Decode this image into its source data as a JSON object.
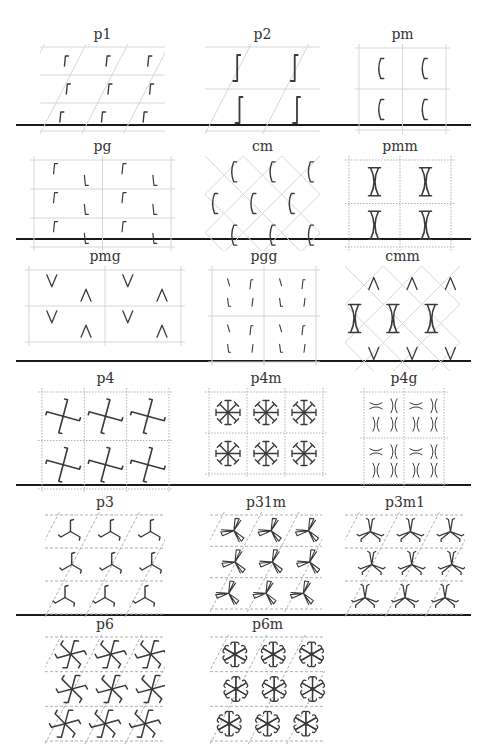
{
  "figure": {
    "colors": {
      "motif": "#3a3a3a",
      "grid_solid": "#d6d6d6",
      "grid_dotted": "#b0b0b0",
      "divider": "#1a1a1a"
    },
    "dividers_y": [
      124,
      238,
      360,
      484,
      614
    ],
    "groups": [
      {
        "id": "p1",
        "label": "p1",
        "x": 40,
        "y": 28,
        "w": 125,
        "h": 90,
        "lattice": "oblique",
        "line": "solid",
        "motif": "hook",
        "rows": 3,
        "cols": 3
      },
      {
        "id": "p2",
        "label": "p2",
        "x": 205,
        "y": 28,
        "w": 115,
        "h": 90,
        "lattice": "oblique",
        "line": "solid",
        "motif": "long-hook",
        "rows": 2,
        "cols": 2
      },
      {
        "id": "pm",
        "label": "pm",
        "x": 355,
        "y": 28,
        "w": 95,
        "h": 90,
        "lattice": "rectangular",
        "line": "solid",
        "motif": "paren",
        "rows": 2,
        "cols": 2
      },
      {
        "id": "pg",
        "label": "pg",
        "x": 30,
        "y": 140,
        "w": 145,
        "h": 95,
        "lattice": "rectangular",
        "line": "solid",
        "motif": "glide-hook",
        "rows": 3,
        "cols": 2
      },
      {
        "id": "cm",
        "label": "cm",
        "x": 205,
        "y": 140,
        "w": 115,
        "h": 95,
        "lattice": "rhombic",
        "line": "solid",
        "motif": "paren",
        "rows": 3,
        "cols": 3
      },
      {
        "id": "pmm",
        "label": "pmm",
        "x": 345,
        "y": 140,
        "w": 110,
        "h": 95,
        "lattice": "rectangular",
        "line": "dotted",
        "motif": "x-bar",
        "rows": 2,
        "cols": 2
      },
      {
        "id": "pmg",
        "label": "pmg",
        "x": 25,
        "y": 250,
        "w": 160,
        "h": 80,
        "lattice": "rectangular",
        "line": "solid",
        "motif": "chevron",
        "rows": 2,
        "cols": 2
      },
      {
        "id": "pgg",
        "label": "pgg",
        "x": 208,
        "y": 250,
        "w": 112,
        "h": 100,
        "lattice": "rectangular",
        "line": "solid",
        "motif": "pgg-tick",
        "rows": 2,
        "cols": 2
      },
      {
        "id": "cmm",
        "label": "cmm",
        "x": 345,
        "y": 250,
        "w": 115,
        "h": 105,
        "lattice": "rhombic",
        "line": "solid",
        "motif": "cmm",
        "rows": 3,
        "cols": 3
      },
      {
        "id": "p4",
        "label": "p4",
        "x": 38,
        "y": 372,
        "w": 135,
        "h": 105,
        "lattice": "square",
        "line": "dotted",
        "motif": "pinwheel4",
        "rows": 2,
        "cols": 3
      },
      {
        "id": "p4m",
        "label": "p4m",
        "x": 205,
        "y": 372,
        "w": 122,
        "h": 90,
        "lattice": "square",
        "line": "dotted",
        "motif": "star8",
        "rows": 2,
        "cols": 3
      },
      {
        "id": "p4g",
        "label": "p4g",
        "x": 360,
        "y": 372,
        "w": 88,
        "h": 100,
        "lattice": "square",
        "line": "dotted",
        "motif": "p4g",
        "rows": 2,
        "cols": 2
      },
      {
        "id": "p3",
        "label": "p3",
        "x": 45,
        "y": 496,
        "w": 120,
        "h": 105,
        "lattice": "hexagonal",
        "line": "dashed",
        "motif": "tri-hook",
        "rows": 3,
        "cols": 3
      },
      {
        "id": "p31m",
        "label": "p31m",
        "x": 210,
        "y": 496,
        "w": 112,
        "h": 100,
        "lattice": "hexagonal",
        "line": "dashed",
        "motif": "p31m",
        "rows": 3,
        "cols": 3
      },
      {
        "id": "p3m1",
        "label": "p3m1",
        "x": 345,
        "y": 496,
        "w": 120,
        "h": 105,
        "lattice": "hexagonal",
        "line": "dashed",
        "motif": "p3m1",
        "rows": 3,
        "cols": 3
      },
      {
        "id": "p6",
        "label": "p6",
        "x": 45,
        "y": 618,
        "w": 120,
        "h": 110,
        "lattice": "hexagonal",
        "line": "dashed",
        "motif": "six-hook",
        "rows": 3,
        "cols": 3
      },
      {
        "id": "p6m",
        "label": "p6m",
        "x": 210,
        "y": 618,
        "w": 115,
        "h": 110,
        "lattice": "hexagonal",
        "line": "dashed",
        "motif": "star12",
        "rows": 3,
        "cols": 3
      }
    ]
  }
}
